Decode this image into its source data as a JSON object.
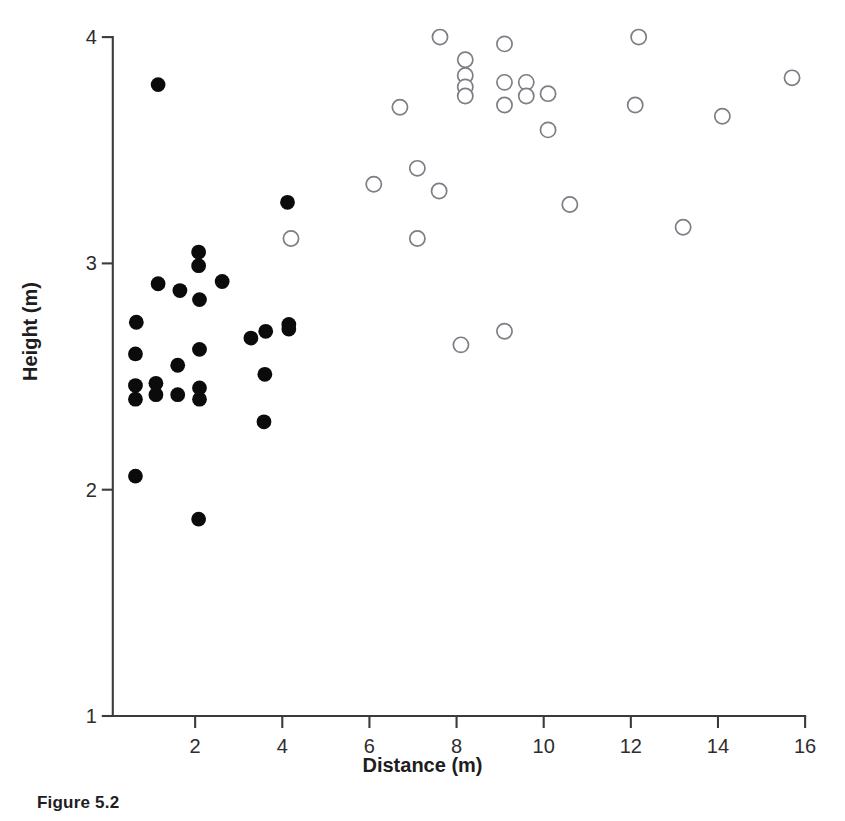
{
  "figure": {
    "caption": "Figure 5.2"
  },
  "axes": {
    "x_title": "Distance (m)",
    "y_title": "Height (m)",
    "x_ticks": [
      "2",
      "4",
      "6",
      "8",
      "10",
      "12",
      "14",
      "16"
    ],
    "y_ticks": [
      "4",
      "3",
      "2",
      "1"
    ]
  },
  "chart_data": {
    "type": "scatter",
    "title": "Figure 5.2",
    "xlabel": "Distance (m)",
    "ylabel": "Height (m)",
    "xlim": [
      0.1,
      16.0
    ],
    "ylim": [
      1.0,
      4.0
    ],
    "xticks": [
      2,
      4,
      6,
      8,
      10,
      12,
      14,
      16
    ],
    "yticks": [
      1,
      2,
      3,
      4
    ],
    "grid": false,
    "legend": "none",
    "marker_colors": {
      "filled": "#0b0b0b",
      "open_fill": "#ffffff",
      "open_stroke": "#7d7d85",
      "axis": "#3b3b3f"
    },
    "series": [
      {
        "name": "filled",
        "marker": "filled-circle",
        "points": [
          [
            1.15,
            3.79
          ],
          [
            4.12,
            3.27
          ],
          [
            2.08,
            3.05
          ],
          [
            2.08,
            2.99
          ],
          [
            2.62,
            2.92
          ],
          [
            1.15,
            2.91
          ],
          [
            1.65,
            2.88
          ],
          [
            2.1,
            2.84
          ],
          [
            0.65,
            2.74
          ],
          [
            4.15,
            2.73
          ],
          [
            4.15,
            2.71
          ],
          [
            3.62,
            2.7
          ],
          [
            3.28,
            2.67
          ],
          [
            2.1,
            2.62
          ],
          [
            0.63,
            2.6
          ],
          [
            1.6,
            2.55
          ],
          [
            0.63,
            2.46
          ],
          [
            1.1,
            2.47
          ],
          [
            2.1,
            2.45
          ],
          [
            1.1,
            2.42
          ],
          [
            1.6,
            2.42
          ],
          [
            0.63,
            2.4
          ],
          [
            2.1,
            2.4
          ],
          [
            3.6,
            2.51
          ],
          [
            3.58,
            2.3
          ],
          [
            0.63,
            2.06
          ],
          [
            2.08,
            1.87
          ]
        ]
      },
      {
        "name": "open",
        "marker": "open-circle",
        "points": [
          [
            7.62,
            4.0
          ],
          [
            12.18,
            4.0
          ],
          [
            9.1,
            3.97
          ],
          [
            8.2,
            3.9
          ],
          [
            15.7,
            3.82
          ],
          [
            8.2,
            3.83
          ],
          [
            9.1,
            3.8
          ],
          [
            9.6,
            3.8
          ],
          [
            8.2,
            3.78
          ],
          [
            9.6,
            3.74
          ],
          [
            8.2,
            3.74
          ],
          [
            10.1,
            3.75
          ],
          [
            6.7,
            3.69
          ],
          [
            9.1,
            3.7
          ],
          [
            12.1,
            3.7
          ],
          [
            14.1,
            3.65
          ],
          [
            10.1,
            3.59
          ],
          [
            7.1,
            3.42
          ],
          [
            6.1,
            3.35
          ],
          [
            7.6,
            3.32
          ],
          [
            10.6,
            3.26
          ],
          [
            13.2,
            3.16
          ],
          [
            7.1,
            3.11
          ],
          [
            4.2,
            3.11
          ],
          [
            9.1,
            2.7
          ],
          [
            8.1,
            2.64
          ]
        ]
      }
    ]
  }
}
